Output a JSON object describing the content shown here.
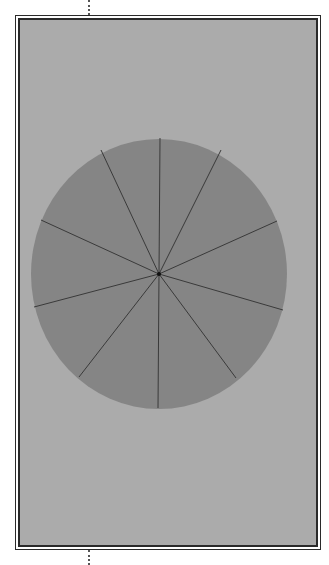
{
  "figure": {
    "background_color": "#ffffff",
    "panel_fill": "#ababab",
    "frame_color": "#2a2a2a",
    "disk": {
      "fill": "#858585",
      "stroke": "#3a3a3a",
      "center": [
        159,
        274
      ],
      "rx": 128,
      "ry": 135,
      "segments": 10
    },
    "spoke_endpoints": [
      [
        160,
        138
      ],
      [
        221,
        150
      ],
      [
        277,
        221
      ],
      [
        283,
        310
      ],
      [
        236,
        378
      ],
      [
        158,
        408
      ],
      [
        79,
        377
      ],
      [
        34,
        307
      ],
      [
        41,
        220
      ],
      [
        101,
        150
      ]
    ]
  }
}
